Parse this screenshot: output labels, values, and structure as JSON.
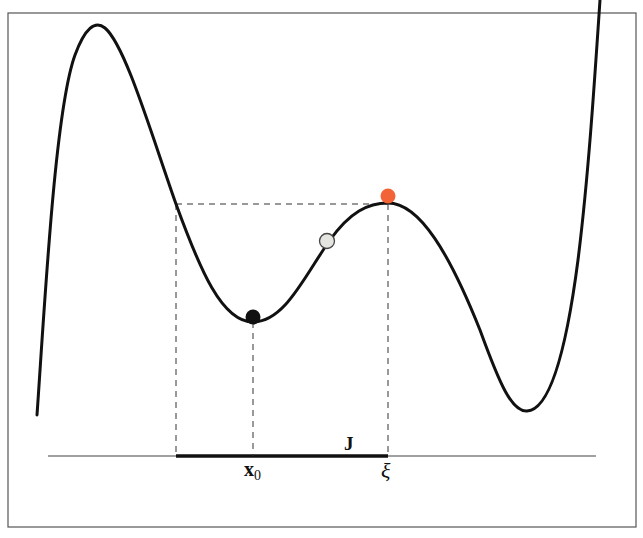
{
  "diagram": {
    "labels": {
      "interval": "J",
      "equilibrium_point": "x",
      "equilibrium_subscript": "0",
      "turning_point": "ξ"
    },
    "balls": [
      {
        "name": "ball-at-minimum",
        "color": "#111111",
        "position": "local minimum at x0"
      },
      {
        "name": "ball-on-slope",
        "color": "#e4e4e0",
        "position": "on slope between x0 and xi"
      },
      {
        "name": "ball-at-maximum",
        "color": "#f26437",
        "position": "local maximum at xi"
      }
    ],
    "colors": {
      "curve": "#111111",
      "guides": "#333333",
      "frame": "#555555",
      "accent_ball": "#f26437",
      "light_ball": "#e4e4e0"
    }
  }
}
